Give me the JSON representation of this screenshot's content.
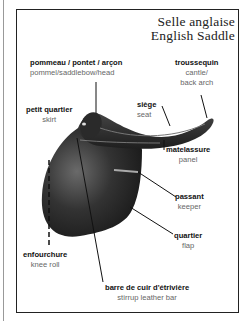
{
  "title": {
    "fr": "Selle anglaise",
    "en": "English Saddle"
  },
  "labels": {
    "pommel": {
      "fr": "pommeau / pontet / arçon",
      "en": "pommel/saddlebow/head"
    },
    "cantle": {
      "fr": "troussequin",
      "en1": "cantle/",
      "en2": "back arch"
    },
    "skirt": {
      "fr": "petit quartier",
      "en": "skirt"
    },
    "seat": {
      "fr": "siège",
      "en": "seat"
    },
    "panel": {
      "fr": "matelassure",
      "en": "panel"
    },
    "keeper": {
      "fr": "passant",
      "en": "keeper"
    },
    "flap": {
      "fr": "quartier",
      "en": "flap"
    },
    "kneeroll": {
      "fr": "enfourchure",
      "en": "knee roll"
    },
    "stirrupbar": {
      "fr": "barre de cuir d'étrivière",
      "en": "stirrup leather bar"
    }
  }
}
